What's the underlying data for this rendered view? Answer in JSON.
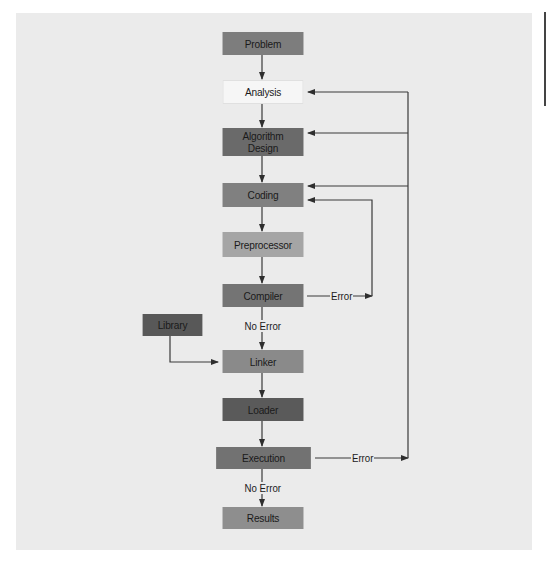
{
  "diagram": {
    "colors": {
      "background": "#ebebeb",
      "line": "#3a3a3a",
      "problem": "#7d7d7d",
      "analysis": "#f6f6f6",
      "algorithm": "#6a6a6a",
      "coding": "#808080",
      "preprocessor": "#a5a5a5",
      "compiler": "#747474",
      "library": "#585858",
      "linker": "#8a8a8a",
      "loader": "#5a5a5a",
      "execution": "#727272",
      "results": "#8e8e8e"
    },
    "nodes": {
      "problem": "Problem",
      "analysis": "Analysis",
      "algorithm_line1": "Algorithm",
      "algorithm_line2": "Design",
      "coding": "Coding",
      "preprocessor": "Preprocessor",
      "compiler": "Compiler",
      "library": "Library",
      "linker": "Linker",
      "loader": "Loader",
      "execution": "Execution",
      "results": "Results"
    },
    "edge_labels": {
      "compiler_error": "Error",
      "compiler_no_error": "No Error",
      "execution_error": "Error",
      "execution_no_error": "No Error"
    }
  }
}
